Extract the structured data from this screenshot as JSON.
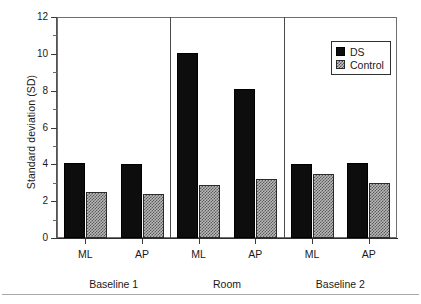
{
  "chart_data": {
    "type": "bar",
    "title": "",
    "xlabel": "",
    "ylabel": "Standard deviation (SD)",
    "ylim": [
      0,
      12
    ],
    "ytick_labels": [
      "0",
      "2",
      "4",
      "6",
      "8",
      "10",
      "12"
    ],
    "ytick_values": [
      0,
      2,
      4,
      6,
      8,
      10,
      12
    ],
    "yminor_values": [
      1,
      3,
      5,
      7,
      9,
      11
    ],
    "grid": false,
    "legend_position": "top-right-inside",
    "categories": [
      "ML",
      "AP",
      "ML",
      "AP",
      "ML",
      "AP"
    ],
    "groups": [
      {
        "label": "Baseline 1",
        "categories": [
          "ML",
          "AP"
        ]
      },
      {
        "label": "Room",
        "categories": [
          "ML",
          "AP"
        ]
      },
      {
        "label": "Baseline 2",
        "categories": [
          "ML",
          "AP"
        ]
      }
    ],
    "series": [
      {
        "name": "DS",
        "color": "#0d0d0d",
        "fill": "solid-black",
        "values": [
          4.1,
          4.0,
          10.05,
          8.1,
          4.0,
          4.1
        ]
      },
      {
        "name": "Control",
        "color": "#b9b9b9",
        "fill": "checkered-hatch",
        "values": [
          2.5,
          2.4,
          2.9,
          3.2,
          3.5,
          3.0
        ]
      }
    ]
  },
  "legend": {
    "entries": [
      {
        "label": "DS"
      },
      {
        "label": "Control"
      }
    ]
  },
  "axis": {
    "y_title": "Standard deviation (SD)"
  }
}
